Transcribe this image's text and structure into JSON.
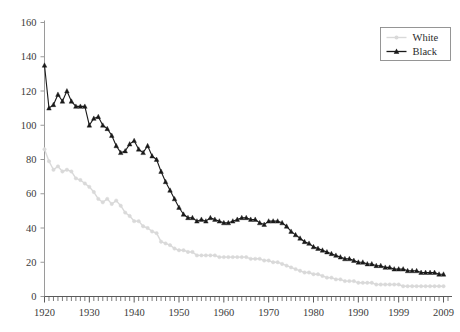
{
  "chart_data": {
    "type": "line",
    "title": "",
    "subtitle": "",
    "xlabel": "",
    "ylabel": "",
    "xlim": [
      1920,
      2010
    ],
    "ylim": [
      0,
      160
    ],
    "ytick_values": [
      0,
      20,
      40,
      60,
      80,
      100,
      120,
      140,
      160
    ],
    "ytick_labels": [
      "0",
      "20",
      "40",
      "60",
      "80",
      "100",
      "120",
      "140",
      "160"
    ],
    "xtick_labels": [
      "1920",
      "1930",
      "1940",
      "1950",
      "1960",
      "1970",
      "1980",
      "1990",
      "1999",
      "2009"
    ],
    "xtick_values": [
      1920,
      1930,
      1940,
      1950,
      1960,
      1970,
      1980,
      1990,
      1999,
      2009
    ],
    "minor_xticks_interval": 1,
    "grid": false,
    "legend_position": "top-right",
    "legend_border": true,
    "x": [
      1920,
      1921,
      1922,
      1923,
      1924,
      1925,
      1926,
      1927,
      1928,
      1929,
      1930,
      1931,
      1932,
      1933,
      1934,
      1935,
      1936,
      1937,
      1938,
      1939,
      1940,
      1941,
      1942,
      1943,
      1944,
      1945,
      1946,
      1947,
      1948,
      1949,
      1950,
      1951,
      1952,
      1953,
      1954,
      1955,
      1956,
      1957,
      1958,
      1959,
      1960,
      1961,
      1962,
      1963,
      1964,
      1965,
      1966,
      1967,
      1968,
      1969,
      1970,
      1971,
      1972,
      1973,
      1974,
      1975,
      1976,
      1977,
      1978,
      1979,
      1980,
      1981,
      1982,
      1983,
      1984,
      1985,
      1986,
      1987,
      1988,
      1989,
      1990,
      1991,
      1992,
      1993,
      1994,
      1995,
      1996,
      1997,
      1998,
      1999,
      2000,
      2001,
      2002,
      2003,
      2004,
      2005,
      2006,
      2007,
      2008,
      2009
    ],
    "series": [
      {
        "name": "White",
        "color": "#d9d9d9",
        "marker": "dot",
        "values": [
          86,
          79,
          74,
          76,
          73,
          74,
          73,
          69,
          68,
          66,
          64,
          61,
          57,
          55,
          57,
          54,
          56,
          53,
          49,
          47,
          44,
          44,
          41,
          40,
          38,
          37,
          32,
          31,
          30,
          28,
          27,
          27,
          26,
          26,
          24,
          24,
          24,
          24,
          24,
          23,
          23,
          23,
          23,
          23,
          23,
          23,
          22,
          22,
          22,
          21,
          21,
          20,
          20,
          19,
          18,
          17,
          16,
          15,
          14,
          14,
          13,
          13,
          12,
          11,
          11,
          10,
          10,
          9,
          9,
          9,
          8,
          8,
          8,
          8,
          7,
          7,
          7,
          7,
          7,
          7,
          6,
          6,
          6,
          6,
          6,
          6,
          6,
          6,
          6,
          6
        ]
      },
      {
        "name": "Black",
        "color": "#1a1a1a",
        "marker": "triangle",
        "values": [
          135,
          110,
          112,
          118,
          114,
          120,
          114,
          111,
          111,
          111,
          100,
          104,
          105,
          100,
          98,
          94,
          88,
          84,
          85,
          89,
          91,
          86,
          84,
          88,
          82,
          80,
          73,
          67,
          62,
          57,
          52,
          48,
          46,
          46,
          44,
          45,
          44,
          46,
          45,
          44,
          43,
          43,
          44,
          45,
          46,
          46,
          45,
          45,
          43,
          42,
          44,
          44,
          44,
          43,
          41,
          38,
          36,
          34,
          32,
          31,
          29,
          28,
          27,
          26,
          25,
          24,
          23,
          22,
          22,
          21,
          20,
          20,
          19,
          19,
          18,
          18,
          17,
          17,
          16,
          16,
          16,
          15,
          15,
          15,
          14,
          14,
          14,
          14,
          13,
          13
        ]
      }
    ]
  },
  "legend": {
    "items": [
      {
        "label": "White",
        "color": "#d9d9d9",
        "marker": "dot"
      },
      {
        "label": "Black",
        "color": "#1a1a1a",
        "marker": "triangle"
      }
    ]
  },
  "caption": {
    "text": ""
  }
}
